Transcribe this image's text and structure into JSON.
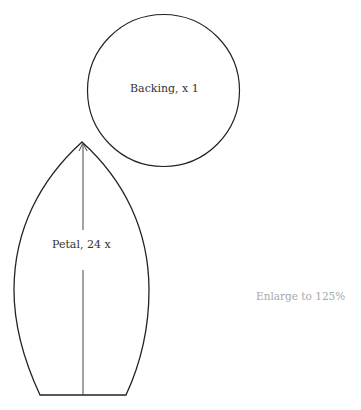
{
  "pattern": {
    "pieces": [
      {
        "name": "backing",
        "label": "Backing, x 1",
        "shape": "circle"
      },
      {
        "name": "petal",
        "label": "Petal, 24 x",
        "shape": "pointed-petal"
      }
    ],
    "note": "Enlarge to 125%"
  },
  "colors": {
    "line": "#222222",
    "note_text": "#a8a8a8"
  }
}
